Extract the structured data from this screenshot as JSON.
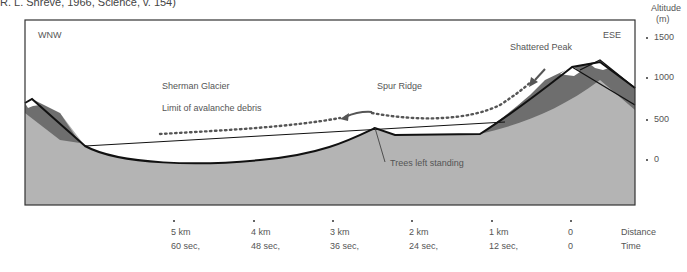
{
  "caption": "R. L. Shreve, 1966, Science, v. 154)",
  "diagram": {
    "direction_left": "WNW",
    "direction_right": "ESE",
    "labels": {
      "shattered_peak": "Shattered Peak",
      "sherman_glacier": "Sherman Glacier",
      "spur_ridge": "Spur Ridge",
      "limit_debris": "Limit of avalanche debris",
      "trees": "Trees left standing"
    },
    "colors": {
      "ground": "#b4b4b4",
      "rock": "#6e6e6e",
      "snow": "#ffffff",
      "outline": "#111111",
      "debris_dots": "#555555"
    }
  },
  "altitude_axis": {
    "title": "Altitude",
    "unit": "(m)",
    "ticks": [
      "1500",
      "1000",
      "500",
      "0"
    ]
  },
  "distance_axis": {
    "title": "Distance",
    "ticks": [
      "5 km",
      "4 km",
      "3 km",
      "2 km",
      "1 km",
      "0"
    ]
  },
  "time_axis": {
    "title": "Time",
    "ticks": [
      "60 sec,",
      "48 sec,",
      "36 sec,",
      "24 sec,",
      "12 sec,",
      "0"
    ]
  }
}
